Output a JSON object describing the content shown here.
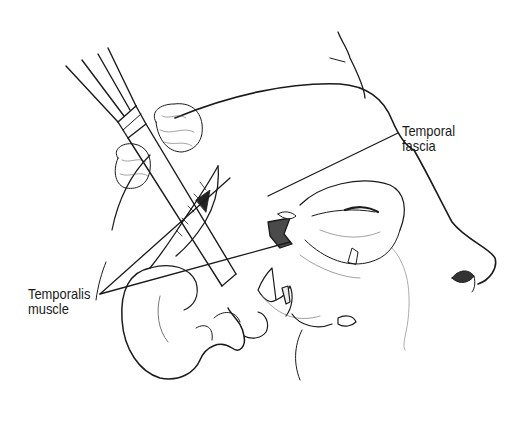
{
  "figure": {
    "background_color": "#ffffff",
    "line_color": "#1a1a1a",
    "labels": {
      "temporal_fascia": {
        "line1": "Temporal",
        "line2": "fascia"
      },
      "temporalis_muscle": {
        "line1": "Temporalis",
        "line2": "muscle"
      }
    }
  }
}
